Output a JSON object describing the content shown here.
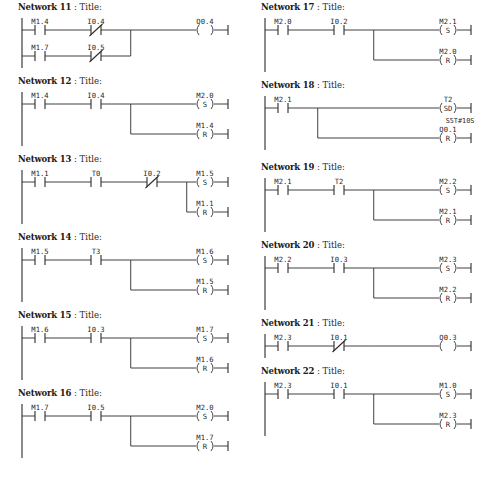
{
  "document": {
    "kind": "ladder-logic-diagram",
    "caption": "",
    "header_separator": ":",
    "network_word": "Network",
    "title_word": "Title:"
  },
  "columns": [
    {
      "side": "left",
      "networks": [
        {
          "id": "net-11",
          "number": "11",
          "title": "Title:",
          "rows": [
            {
              "contacts": [
                {
                  "label": "M1.4",
                  "type": "NO"
                },
                {
                  "label": "I0.4",
                  "type": "NC"
                }
              ]
            },
            {
              "contacts": [
                {
                  "label": "M1.7",
                  "type": "NO"
                },
                {
                  "label": "I0.5",
                  "type": "NC"
                }
              ]
            }
          ],
          "outputs": [
            {
              "label": "Q0.4",
              "type": "coil",
              "symbol": "( )"
            }
          ]
        },
        {
          "id": "net-12",
          "number": "12",
          "title": "Title:",
          "rows": [
            {
              "contacts": [
                {
                  "label": "M1.4",
                  "type": "NO"
                },
                {
                  "label": "I0.4",
                  "type": "NO"
                }
              ]
            }
          ],
          "outputs": [
            {
              "label": "M2.0",
              "type": "set",
              "symbol": "(S)"
            },
            {
              "label": "M1.4",
              "type": "reset",
              "symbol": "(R)"
            }
          ]
        },
        {
          "id": "net-13",
          "number": "13",
          "title": "Title:",
          "rows": [
            {
              "contacts": [
                {
                  "label": "M1.1",
                  "type": "NO"
                },
                {
                  "label": "T0",
                  "type": "NO"
                },
                {
                  "label": "I0.2",
                  "type": "NC"
                }
              ]
            }
          ],
          "outputs": [
            {
              "label": "M1.5",
              "type": "set",
              "symbol": "(S)"
            },
            {
              "label": "M1.1",
              "type": "reset",
              "symbol": "(R)"
            }
          ]
        },
        {
          "id": "net-14",
          "number": "14",
          "title": "Title:",
          "rows": [
            {
              "contacts": [
                {
                  "label": "M1.5",
                  "type": "NO"
                },
                {
                  "label": "T3",
                  "type": "NO"
                }
              ]
            }
          ],
          "outputs": [
            {
              "label": "M1.6",
              "type": "set",
              "symbol": "(S)"
            },
            {
              "label": "M1.5",
              "type": "reset",
              "symbol": "(R)"
            }
          ]
        },
        {
          "id": "net-15",
          "number": "15",
          "title": "Title:",
          "rows": [
            {
              "contacts": [
                {
                  "label": "M1.6",
                  "type": "NO"
                },
                {
                  "label": "I0.3",
                  "type": "NO"
                }
              ]
            }
          ],
          "outputs": [
            {
              "label": "M1.7",
              "type": "set",
              "symbol": "(S)"
            },
            {
              "label": "M1.6",
              "type": "reset",
              "symbol": "(R)"
            }
          ]
        },
        {
          "id": "net-16",
          "number": "16",
          "title": "Title:",
          "rows": [
            {
              "contacts": [
                {
                  "label": "M1.7",
                  "type": "NO"
                },
                {
                  "label": "I0.5",
                  "type": "NO"
                }
              ]
            }
          ],
          "outputs": [
            {
              "label": "M2.0",
              "type": "set",
              "symbol": "(S)"
            },
            {
              "label": "M1.7",
              "type": "reset",
              "symbol": "(R)"
            }
          ]
        }
      ]
    },
    {
      "side": "right",
      "networks": [
        {
          "id": "net-17",
          "number": "17",
          "title": "Title:",
          "rows": [
            {
              "contacts": [
                {
                  "label": "M2.0",
                  "type": "NO"
                },
                {
                  "label": "I0.2",
                  "type": "NO"
                }
              ]
            }
          ],
          "outputs": [
            {
              "label": "M2.1",
              "type": "set",
              "symbol": "(S)"
            },
            {
              "label": "M2.0",
              "type": "reset",
              "symbol": "(R)"
            }
          ]
        },
        {
          "id": "net-18",
          "number": "18",
          "title": "Title:",
          "rows": [
            {
              "contacts": [
                {
                  "label": "M2.1",
                  "type": "NO"
                }
              ]
            }
          ],
          "outputs": [
            {
              "label": "T2",
              "type": "timer",
              "symbol": "(SD)",
              "preset": "S5T#10S"
            },
            {
              "label": "Q0.1",
              "type": "reset",
              "symbol": "(R)"
            }
          ]
        },
        {
          "id": "net-19",
          "number": "19",
          "title": "Title:",
          "rows": [
            {
              "contacts": [
                {
                  "label": "M2.1",
                  "type": "NO"
                },
                {
                  "label": "T2",
                  "type": "NO"
                }
              ]
            }
          ],
          "outputs": [
            {
              "label": "M2.2",
              "type": "set",
              "symbol": "(S)"
            },
            {
              "label": "M2.1",
              "type": "reset",
              "symbol": "(R)"
            }
          ]
        },
        {
          "id": "net-20",
          "number": "20",
          "title": "Title:",
          "rows": [
            {
              "contacts": [
                {
                  "label": "M2.2",
                  "type": "NO"
                },
                {
                  "label": "I0.3",
                  "type": "NO"
                }
              ]
            }
          ],
          "outputs": [
            {
              "label": "M2.3",
              "type": "set",
              "symbol": "(S)"
            },
            {
              "label": "M2.2",
              "type": "reset",
              "symbol": "(R)"
            }
          ]
        },
        {
          "id": "net-21",
          "number": "21",
          "title": "Title:",
          "rows": [
            {
              "contacts": [
                {
                  "label": "M2.3",
                  "type": "NO"
                },
                {
                  "label": "I0.1",
                  "type": "NC"
                }
              ]
            }
          ],
          "outputs": [
            {
              "label": "Q0.3",
              "type": "coil",
              "symbol": "( )"
            }
          ]
        },
        {
          "id": "net-22",
          "number": "22",
          "title": "Title:",
          "rows": [
            {
              "contacts": [
                {
                  "label": "M2.3",
                  "type": "NO"
                },
                {
                  "label": "I0.1",
                  "type": "NO"
                }
              ]
            }
          ],
          "outputs": [
            {
              "label": "M1.0",
              "type": "set",
              "symbol": "(S)"
            },
            {
              "label": "M2.3",
              "type": "reset",
              "symbol": "(R)"
            }
          ]
        }
      ]
    }
  ]
}
